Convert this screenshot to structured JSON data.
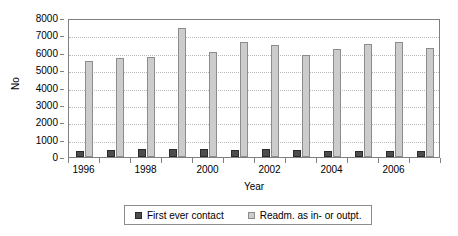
{
  "chart_data": {
    "type": "bar",
    "title": "",
    "xlabel": "Year",
    "ylabel": "No",
    "ylim": [
      0,
      8000
    ],
    "ytick_step": 1000,
    "grid": true,
    "legend_position": "bottom",
    "categories": [
      "1996",
      "1997",
      "1998",
      "1999",
      "2000",
      "2001",
      "2002",
      "2003",
      "2004",
      "2005",
      "2006",
      "2007"
    ],
    "xtick_labels_shown": [
      "1996",
      "1998",
      "2000",
      "2002",
      "2004",
      "2006"
    ],
    "yticks": [
      "0",
      "1000",
      "2000",
      "3000",
      "4000",
      "5000",
      "6000",
      "7000",
      "8000"
    ],
    "series": [
      {
        "name": "First ever contact",
        "color": "#4d4d4d",
        "values": [
          370,
          430,
          440,
          490,
          450,
          430,
          440,
          380,
          370,
          350,
          350,
          360
        ]
      },
      {
        "name": "Readm. as in- or outpt.",
        "color": "#cccccc",
        "values": [
          5500,
          5700,
          5760,
          7450,
          6060,
          6600,
          6450,
          5880,
          6200,
          6480,
          6620,
          6300
        ]
      }
    ]
  },
  "legend": {
    "entries": [
      {
        "label": "First ever contact",
        "swatch": "dark"
      },
      {
        "label": "Readm. as in- or outpt.",
        "swatch": "light"
      }
    ]
  },
  "axes": {
    "y_title": "No",
    "x_title": "Year"
  }
}
